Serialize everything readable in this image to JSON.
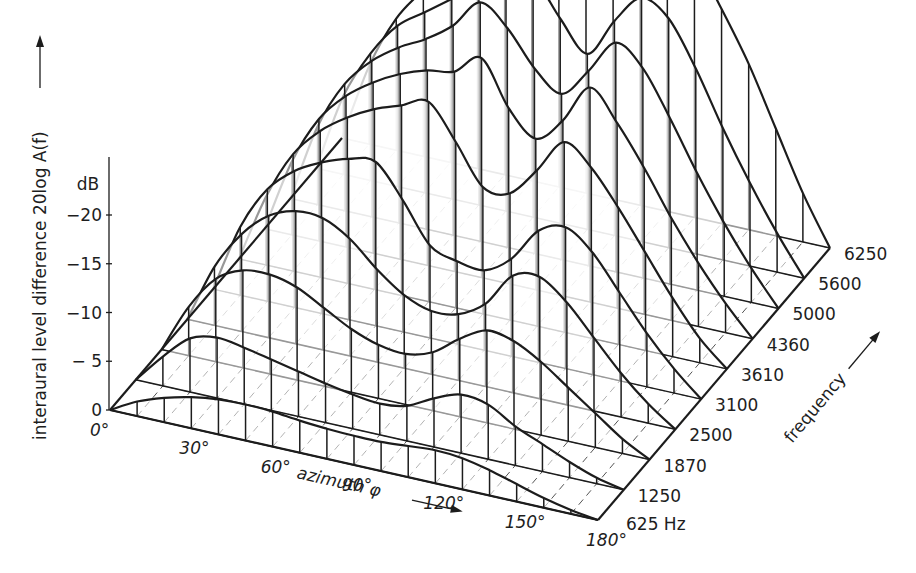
{
  "chart_data": {
    "type": "surface-3d-waterfall",
    "title": "",
    "zlabel": "interaural level difference 20log A(f)",
    "zunit": "dB",
    "ztick_labels": [
      "0",
      "− 5",
      "−10",
      "−15",
      "−20"
    ],
    "zticks": [
      0,
      -5,
      -10,
      -15,
      -20
    ],
    "xlabel": "azimuth φ",
    "xtick_labels": [
      "0°",
      "30°",
      "60°",
      "90°",
      "120°",
      "150°",
      "180°"
    ],
    "x": [
      0,
      10,
      20,
      30,
      40,
      50,
      60,
      70,
      80,
      90,
      100,
      110,
      120,
      130,
      140,
      150,
      160,
      170,
      180
    ],
    "ylabel": "frequency",
    "ytick_labels": [
      "625 Hz",
      "1250",
      "1870",
      "2500",
      "3100",
      "3610",
      "4360",
      "5000",
      "5600",
      "6250"
    ],
    "series": [
      {
        "name": "625 Hz",
        "values": [
          0,
          1.5,
          2.5,
          3.2,
          3.6,
          3.7,
          3.6,
          3.3,
          3.1,
          3.0,
          3.0,
          3.2,
          3.4,
          3.2,
          2.6,
          1.8,
          1.0,
          0.4,
          0
        ]
      },
      {
        "name": "1250",
        "values": [
          0,
          3,
          5.5,
          6.2,
          5.8,
          5.2,
          4.6,
          4.0,
          3.5,
          3.2,
          3.6,
          5.0,
          6.0,
          5.6,
          4.0,
          2.8,
          1.6,
          0.6,
          0
        ]
      },
      {
        "name": "1870",
        "values": [
          0,
          5,
          8.5,
          10,
          10.2,
          9.5,
          8.0,
          6.5,
          5.5,
          5.2,
          6.0,
          8.0,
          9.5,
          9.0,
          7.5,
          5.5,
          3.5,
          1.5,
          0
        ]
      },
      {
        "name": "2500",
        "values": [
          0,
          6,
          10,
          12.5,
          13.6,
          13.5,
          12.0,
          9.5,
          7.5,
          6.5,
          6.8,
          8.5,
          12.0,
          12.5,
          10.5,
          7.5,
          4.5,
          2.0,
          0
        ]
      },
      {
        "name": "3100",
        "values": [
          0,
          7,
          11.5,
          14,
          15.5,
          16.5,
          16.8,
          13.5,
          9.5,
          8.5,
          8.2,
          10.0,
          13.5,
          14.5,
          12.5,
          9.0,
          5.5,
          2.5,
          0
        ]
      },
      {
        "name": "3610",
        "values": [
          0,
          7,
          12,
          15,
          17,
          18.5,
          19.5,
          20.5,
          17,
          13,
          13.0,
          16.0,
          19.5,
          17.5,
          14.0,
          10.0,
          6.0,
          2.5,
          0
        ]
      },
      {
        "name": "4360",
        "values": [
          0,
          7.5,
          12.5,
          15.5,
          17.5,
          19.0,
          20.0,
          20.5,
          22.5,
          18.0,
          15.5,
          18.0,
          22.0,
          19.0,
          15.0,
          10.5,
          6.5,
          3.0,
          0
        ]
      },
      {
        "name": "5000",
        "values": [
          0,
          8,
          13,
          16,
          18,
          19.5,
          21.5,
          24.5,
          22.5,
          19.0,
          17.0,
          20.0,
          23.5,
          21.5,
          17.0,
          12.0,
          7.5,
          3.5,
          0
        ]
      },
      {
        "name": "5600",
        "values": [
          0,
          8,
          13,
          16.5,
          18.5,
          20.5,
          22.5,
          24.0,
          24.5,
          21.0,
          18.0,
          22.0,
          25.0,
          23.5,
          19.0,
          13.5,
          8.5,
          4.0,
          0
        ]
      },
      {
        "name": "6250",
        "values": [
          0,
          8,
          13.5,
          17,
          19.5,
          22,
          25,
          28,
          27,
          28,
          25,
          23,
          28,
          26.5,
          22,
          17,
          11,
          5,
          0
        ]
      }
    ],
    "zlim": [
      0,
      -20
    ],
    "grid": true,
    "legend": "none"
  }
}
